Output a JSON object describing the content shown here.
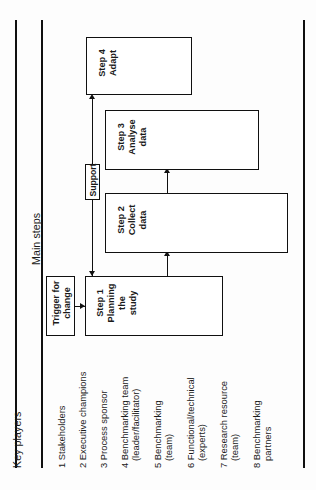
{
  "figure": {
    "orientation": "rotated-90-ccw",
    "headers": {
      "main_steps": "Main steps",
      "key_players": "Key players"
    }
  },
  "process": {
    "trigger": {
      "line1": "Trigger for",
      "line2": "change"
    },
    "support": {
      "label": "Support"
    },
    "steps": [
      {
        "number": "Step 1",
        "line1": "Planning",
        "line2": "the",
        "line3": "study"
      },
      {
        "number": "Step 2",
        "line1": "Collect",
        "line2": "data",
        "line3": ""
      },
      {
        "number": "Step 3",
        "line1": "Analyse",
        "line2": "data",
        "line3": ""
      },
      {
        "number": "Step 4",
        "line1": "Adapt",
        "line2": "",
        "line3": ""
      }
    ]
  },
  "key_players": [
    {
      "num": "1",
      "line1": "Stakeholders",
      "line2": ""
    },
    {
      "num": "2",
      "line1": "Executive champions",
      "line2": ""
    },
    {
      "num": "3",
      "line1": "Process sponsor",
      "line2": ""
    },
    {
      "num": "4",
      "line1": "Benchmarking team",
      "line2": "(leader/facilitator)"
    },
    {
      "num": "5",
      "line1": "Benchmarking",
      "line2": "(team)"
    },
    {
      "num": "6",
      "line1": "Functional/technical",
      "line2": "(experts)"
    },
    {
      "num": "7",
      "line1": "Research resource",
      "line2": "(team)"
    },
    {
      "num": "8",
      "line1": "Benchmarking",
      "line2": "partners"
    }
  ],
  "colors": {
    "ink": "#101010",
    "paper": "#fdfdfd"
  }
}
